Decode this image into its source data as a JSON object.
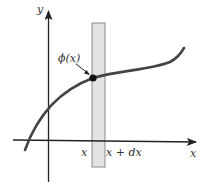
{
  "diagram": {
    "type": "function-plot-with-strip",
    "axes": {
      "x_label": "x",
      "y_label": "y"
    },
    "curve": {
      "label": "ϕ(x)",
      "point_label": "ϕ(x)"
    },
    "strip": {
      "left_label": "x",
      "right_label": "x + dx"
    },
    "colors": {
      "axis": "#222222",
      "curve": "#444444",
      "strip_fill": "#e3e3e3",
      "strip_edge": "#8a8a8a",
      "point": "#111111"
    }
  }
}
